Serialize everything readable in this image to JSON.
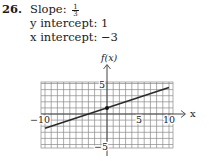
{
  "problem": {
    "number": "26.",
    "slope_label": "Slope:",
    "slope_numerator": "1",
    "slope_denominator": "3",
    "y_intercept_text": "y intercept: 1",
    "x_intercept_text": "x intercept: −3"
  },
  "graph": {
    "y_axis_label": "f(x)",
    "x_axis_label": "x",
    "tick_labels": {
      "x_neg": "−10",
      "x_pos_5": "5",
      "x_pos_10": "10",
      "y_pos_5": "5",
      "y_neg_5": "−5"
    },
    "colors": {
      "grid": "#7a7a7a",
      "line": "#2a2a2a",
      "axis": "#555555"
    }
  },
  "chart_data": {
    "type": "line",
    "title": "",
    "xlabel": "x",
    "ylabel": "f(x)",
    "xlim": [
      -10.6,
      10.6
    ],
    "ylim": [
      -5.4,
      5.3
    ],
    "grid": true,
    "equation": "f(x) = (1/3)x + 1",
    "slope": 0.3333,
    "y_intercept": 1,
    "x_intercept": -3,
    "series": [
      {
        "name": "f(x)",
        "x": [
          -10,
          -3,
          0,
          10
        ],
        "y": [
          -2.33,
          0,
          1,
          4.33
        ]
      }
    ],
    "marked_points": [
      {
        "x": 0,
        "y": 1
      }
    ],
    "x_ticks_labeled": [
      -10,
      5,
      10
    ],
    "y_ticks_labeled": [
      5,
      -5
    ]
  }
}
